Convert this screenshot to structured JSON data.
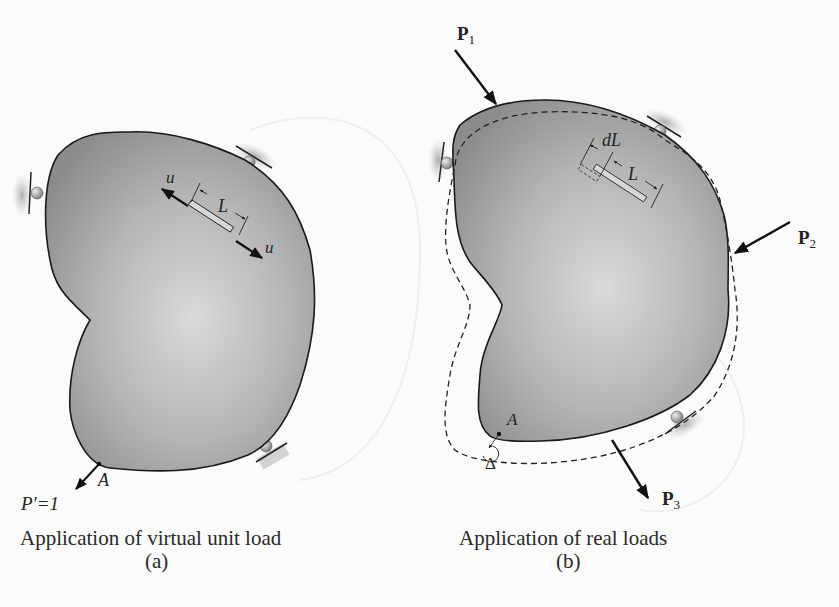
{
  "figure": {
    "panel_a": {
      "caption": "Application of virtual unit load",
      "sublabel": "(a)",
      "force_label_u_left": "u",
      "force_label_u_right": "u",
      "length_label": "L",
      "point_label": "A",
      "unit_load_label": "P′=1"
    },
    "panel_b": {
      "caption": "Application of real loads",
      "sublabel": "(b)",
      "load_labels": {
        "p1": "P",
        "p1_sub": "1",
        "p2": "P",
        "p2_sub": "2",
        "p3": "P",
        "p3_sub": "3"
      },
      "dl_label": "dL",
      "length_label": "L",
      "point_label": "A",
      "displacement_label": "Δ"
    },
    "colors": {
      "body_fill_dark": "#8f8f8f",
      "body_fill_light": "#d6d6d6",
      "outline": "#1a1a1a",
      "background": "#fbfbfb"
    }
  }
}
